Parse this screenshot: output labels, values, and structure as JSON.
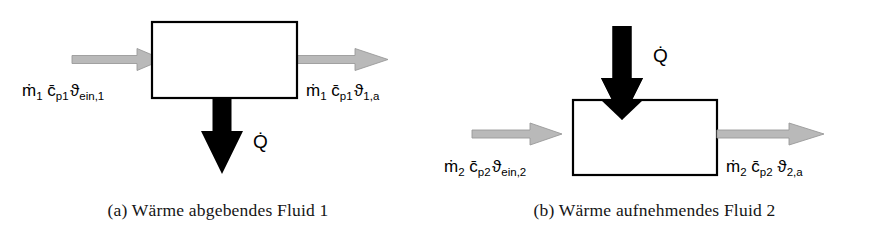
{
  "figure": {
    "background_color": "#ffffff",
    "box_stroke_color": "#000000",
    "gray_arrow_color": "#b9b9b9",
    "black_arrow_color": "#000000"
  },
  "panels": [
    {
      "id": "a",
      "caption": "(a) Wärme abgebendes Fluid 1",
      "box_label": "",
      "heat_direction": "out",
      "heat_symbol": {
        "base": "Q",
        "accent": "̇",
        "full": "Q̇",
        "name": "heat-flow-rate"
      },
      "inlet": {
        "name": "inlet-stream-1",
        "mass_flow": "ṁ",
        "mass_flow_sub": "1",
        "heat_capacity": "c̄",
        "heat_capacity_sub": "p1",
        "temperature": "ϑ",
        "temperature_sub": "ein,1",
        "full": "ṁ1 c̄p1 ϑein,1"
      },
      "outlet": {
        "name": "outlet-stream-1",
        "mass_flow": "ṁ",
        "mass_flow_sub": "1",
        "heat_capacity": "c̄",
        "heat_capacity_sub": "p1",
        "temperature": "ϑ",
        "temperature_sub": "1,a",
        "full": "ṁ1 c̄p1 ϑ1,a"
      }
    },
    {
      "id": "b",
      "caption": "(b) Wärme aufnehmendes Fluid 2",
      "box_label": "",
      "heat_direction": "in",
      "heat_symbol": {
        "base": "Q",
        "accent": "̇",
        "full": "Q̇",
        "name": "heat-flow-rate"
      },
      "inlet": {
        "name": "inlet-stream-2",
        "mass_flow": "ṁ",
        "mass_flow_sub": "2",
        "heat_capacity": "c̄",
        "heat_capacity_sub": "p2",
        "temperature": "ϑ",
        "temperature_sub": "ein,2",
        "full": "ṁ2 c̄p2 ϑein,2"
      },
      "outlet": {
        "name": "outlet-stream-2",
        "mass_flow": "ṁ",
        "mass_flow_sub": "2",
        "heat_capacity": "c̄",
        "heat_capacity_sub": "p2",
        "temperature": "ϑ",
        "temperature_sub": "2,a",
        "full": "ṁ2 c̄p2 ϑ2,a"
      }
    }
  ]
}
